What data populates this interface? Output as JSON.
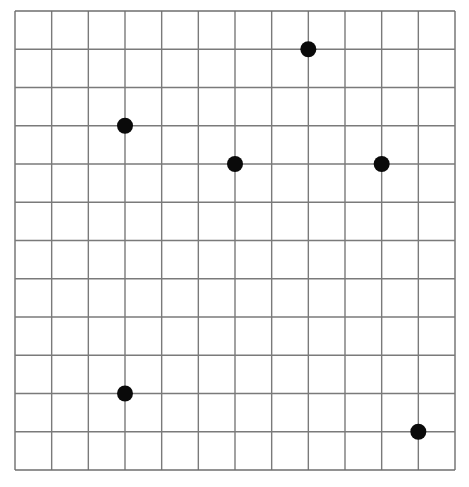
{
  "grid": {
    "columns": 12,
    "rows": 12,
    "origin_px": [
      15,
      11
    ],
    "size_px": [
      440,
      459
    ],
    "line_color": "#7a7a7a",
    "border_color": "#6e6e6e",
    "background": "#ffffff"
  },
  "points": {
    "color": "#0a0a0a",
    "radius_px": 8,
    "items": [
      {
        "col": 3,
        "row": 3
      },
      {
        "col": 8,
        "row": 1
      },
      {
        "col": 6,
        "row": 4
      },
      {
        "col": 10,
        "row": 4
      },
      {
        "col": 3,
        "row": 10
      },
      {
        "col": 11,
        "row": 11
      }
    ]
  }
}
